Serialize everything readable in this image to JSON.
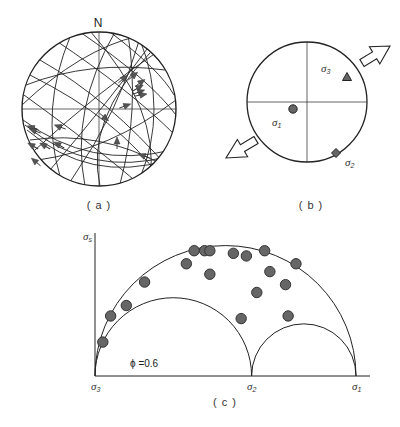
{
  "panels": {
    "a": {
      "caption": "( a )",
      "north_label": "N",
      "type": "stereonet-fault-slip",
      "center": [
        99,
        109
      ],
      "radius": 77,
      "great_circles": [
        {
          "d": "M 40 60 Q 110 100 170 170"
        },
        {
          "d": "M 30 75 Q 120 120 160 178"
        },
        {
          "d": "M 24 95 Q 100 150 140 185"
        },
        {
          "d": "M 55 40 Q 130 90 175 135"
        },
        {
          "d": "M 80 32 Q 150 80 176 115"
        },
        {
          "d": "M 110 32 Q 160 70 174 95"
        },
        {
          "d": "M 35 150 Q 100 90 160 50"
        },
        {
          "d": "M 50 170 Q 110 100 150 45"
        },
        {
          "d": "M 70 182 Q 120 110 140 38"
        },
        {
          "d": "M 85 186 Q 70 110 115 32"
        },
        {
          "d": "M 120 184 Q 140 110 128 34"
        },
        {
          "d": "M 140 178 Q 168 110 140 40"
        },
        {
          "d": "M 60 176 Q 40 110 70 37"
        },
        {
          "d": "M 100 186 Q 85 120 150 53"
        },
        {
          "d": "M 26 85 Q 90 60 165 70"
        },
        {
          "d": "M 23 120 Q 90 170 172 150"
        },
        {
          "d": "M 25 125 Q 90 178 170 156"
        },
        {
          "d": "M 27 130 Q 90 184 168 160"
        },
        {
          "d": "M 22 105 Q 80 50 138 36"
        },
        {
          "d": "M 38 160 Q 110 150 176 100"
        },
        {
          "d": "M 30 140 Q 100 130 163 165"
        },
        {
          "d": "M 90 31 Q 160 110 150 178"
        }
      ],
      "slip_arrows": [
        {
          "x": 123,
          "y": 79,
          "angle": -40
        },
        {
          "x": 133,
          "y": 76,
          "angle": -40
        },
        {
          "x": 140,
          "y": 83,
          "angle": -35
        },
        {
          "x": 138,
          "y": 88,
          "angle": -30
        },
        {
          "x": 139,
          "y": 92,
          "angle": -20
        },
        {
          "x": 141,
          "y": 95,
          "angle": -10
        },
        {
          "x": 125,
          "y": 106,
          "angle": -20
        },
        {
          "x": 104,
          "y": 117,
          "angle": 40
        },
        {
          "x": 33,
          "y": 128,
          "angle": 200
        },
        {
          "x": 35,
          "y": 131,
          "angle": 200
        },
        {
          "x": 60,
          "y": 127,
          "angle": 200
        },
        {
          "x": 33,
          "y": 146,
          "angle": 210
        },
        {
          "x": 45,
          "y": 146,
          "angle": 210
        },
        {
          "x": 59,
          "y": 145,
          "angle": 210
        },
        {
          "x": 36,
          "y": 162,
          "angle": 220
        },
        {
          "x": 117,
          "y": 143,
          "angle": -90
        },
        {
          "x": 144,
          "y": 156,
          "angle": 200
        }
      ]
    },
    "b": {
      "caption": "( b )",
      "type": "principal-stress-stereonet",
      "center": [
        307,
        102
      ],
      "radius": 60,
      "markers": [
        {
          "name": "sigma1",
          "symbol": "circle",
          "x": 293,
          "y": 109,
          "label": "σ",
          "sub": "1",
          "label_x": 272,
          "label_y": 126
        },
        {
          "name": "sigma2",
          "symbol": "diamond",
          "x": 336,
          "y": 153,
          "label": "σ",
          "sub": "2",
          "label_x": 345,
          "label_y": 166
        },
        {
          "name": "sigma3",
          "symbol": "triangle",
          "x": 347,
          "y": 77,
          "label": "σ",
          "sub": "3",
          "label_x": 321,
          "label_y": 72
        }
      ],
      "extension_arrows": [
        {
          "name": "extension-arrow-ne",
          "from": [
            362,
            63
          ],
          "to": [
            390,
            46
          ]
        },
        {
          "name": "extension-arrow-sw",
          "from": [
            256,
            140
          ],
          "to": [
            226,
            158
          ]
        }
      ]
    },
    "c": {
      "caption": "( c )",
      "type": "mohr-circle",
      "y_axis_label": "σ",
      "y_axis_sub": "s",
      "x_ticks": [
        {
          "label": "σ",
          "sub": "3",
          "x": 95
        },
        {
          "label": "σ",
          "sub": "2",
          "x": 251
        },
        {
          "label": "σ",
          "sub": "1",
          "x": 356
        }
      ],
      "phi_label": "ϕ =0.6",
      "stress_ratio_phi": 0.6
    }
  },
  "chart_data": {
    "type": "scatter",
    "xlabel": "σn (normal stress): σ3 → σ2 → σ1",
    "ylabel": "σs (shear stress)",
    "phi": 0.6,
    "axis_marks": {
      "sigma3": 0.0,
      "sigma2": 0.6,
      "sigma1": 1.0
    },
    "circles": [
      {
        "name": "σ1-σ3",
        "center": 0.5,
        "radius": 0.5
      },
      {
        "name": "σ2-σ3",
        "center": 0.3,
        "radius": 0.3
      },
      {
        "name": "σ1-σ2",
        "center": 0.8,
        "radius": 0.2
      }
    ],
    "points": [
      {
        "x": 0.03,
        "y": 0.13
      },
      {
        "x": 0.06,
        "y": 0.23
      },
      {
        "x": 0.12,
        "y": 0.27
      },
      {
        "x": 0.19,
        "y": 0.36
      },
      {
        "x": 0.35,
        "y": 0.43
      },
      {
        "x": 0.38,
        "y": 0.48
      },
      {
        "x": 0.42,
        "y": 0.48
      },
      {
        "x": 0.44,
        "y": 0.48
      },
      {
        "x": 0.44,
        "y": 0.39
      },
      {
        "x": 0.53,
        "y": 0.47
      },
      {
        "x": 0.58,
        "y": 0.46
      },
      {
        "x": 0.65,
        "y": 0.48
      },
      {
        "x": 0.62,
        "y": 0.32
      },
      {
        "x": 0.56,
        "y": 0.22
      },
      {
        "x": 0.67,
        "y": 0.4
      },
      {
        "x": 0.73,
        "y": 0.35
      },
      {
        "x": 0.77,
        "y": 0.43
      },
      {
        "x": 0.74,
        "y": 0.23
      }
    ],
    "plot_pixels": {
      "origin": [
        95,
        376
      ],
      "x_end": 370,
      "y_top": 233,
      "unit_px": 261
    }
  }
}
